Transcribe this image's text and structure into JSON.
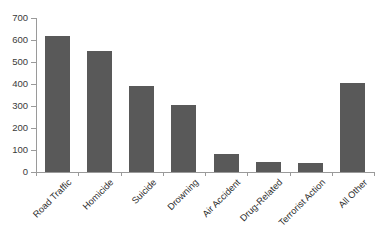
{
  "chart_data": {
    "type": "bar",
    "title": "",
    "subtitle": "",
    "xlabel": "",
    "ylabel": "",
    "categories": [
      "Road Traffic",
      "Homicide",
      "Suicide",
      "Drowning",
      "Air Accident",
      "Drug-Related",
      "Terrorist Action",
      "All Other"
    ],
    "values": [
      620,
      550,
      390,
      305,
      80,
      45,
      40,
      405
    ],
    "ylim": [
      0,
      700
    ],
    "ytick_labels": [
      "700",
      "600",
      "500",
      "400",
      "300",
      "200",
      "100",
      "0"
    ],
    "ytick_values": [
      700,
      600,
      500,
      400,
      300,
      200,
      100,
      0
    ],
    "ytick_step": 100,
    "grid": false,
    "legend": false,
    "bar_color": "#595959",
    "axis_color": "#9a9a9a",
    "label_color": "#2e2e2e",
    "background_color": "#ffffff",
    "xlabel_rotation": -45
  }
}
